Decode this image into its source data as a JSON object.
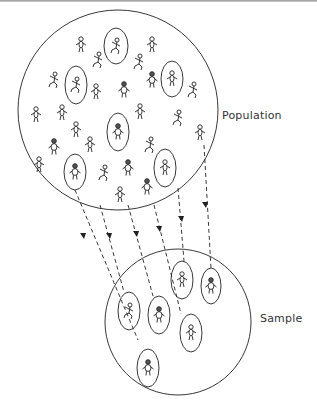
{
  "diagram": {
    "type": "sampling-illustration",
    "labels": {
      "population": "Population",
      "sample": "Sample"
    },
    "colors": {
      "ink": "#222222",
      "text": "#333333",
      "background": "#ffffff",
      "top_rule": "#9a9a9a"
    },
    "population_circle": {
      "cx": 118,
      "cy": 110,
      "r": 100
    },
    "sample_circle": {
      "cx": 178,
      "cy": 322,
      "r": 73
    },
    "population_figures": [
      [
        81,
        45
      ],
      [
        98,
        60
      ],
      [
        54,
        80
      ],
      [
        96,
        92
      ],
      [
        124,
        90
      ],
      [
        152,
        45
      ],
      [
        139,
        62
      ],
      [
        152,
        80
      ],
      [
        193,
        90
      ],
      [
        36,
        115
      ],
      [
        62,
        113
      ],
      [
        76,
        130
      ],
      [
        54,
        147
      ],
      [
        90,
        145
      ],
      [
        39,
        165
      ],
      [
        104,
        173
      ],
      [
        128,
        168
      ],
      [
        178,
        118
      ],
      [
        200,
        133
      ],
      [
        150,
        145
      ],
      [
        140,
        112
      ],
      [
        120,
        195
      ],
      [
        147,
        187
      ]
    ],
    "selected_in_population": [
      {
        "cx": 116,
        "cy": 46,
        "rx": 12,
        "ry": 18
      },
      {
        "cx": 76,
        "cy": 85,
        "rx": 11,
        "ry": 19
      },
      {
        "cx": 172,
        "cy": 79,
        "rx": 11,
        "ry": 18
      },
      {
        "cx": 118,
        "cy": 132,
        "rx": 11,
        "ry": 19
      },
      {
        "cx": 165,
        "cy": 168,
        "rx": 11,
        "ry": 19
      },
      {
        "cx": 75,
        "cy": 172,
        "rx": 11,
        "ry": 18
      }
    ],
    "selected_in_sample": [
      {
        "cx": 182,
        "cy": 280,
        "rx": 11,
        "ry": 19
      },
      {
        "cx": 211,
        "cy": 286,
        "rx": 10,
        "ry": 18
      },
      {
        "cx": 129,
        "cy": 311,
        "rx": 11,
        "ry": 19
      },
      {
        "cx": 159,
        "cy": 315,
        "rx": 11,
        "ry": 19
      },
      {
        "cx": 191,
        "cy": 333,
        "rx": 11,
        "ry": 19
      },
      {
        "cx": 148,
        "cy": 368,
        "rx": 11,
        "ry": 19
      }
    ],
    "arrows": [
      {
        "from": [
          75,
          190
        ],
        "to": [
          148,
          349
        ]
      },
      {
        "from": [
          100,
          205
        ],
        "to": [
          128,
          292
        ]
      },
      {
        "from": [
          128,
          205
        ],
        "to": [
          159,
          296
        ]
      },
      {
        "from": [
          153,
          205
        ],
        "to": [
          181,
          314
        ]
      },
      {
        "from": [
          178,
          188
        ],
        "to": [
          185,
          261
        ]
      },
      {
        "from": [
          204,
          145
        ],
        "to": [
          210,
          268
        ]
      }
    ]
  }
}
